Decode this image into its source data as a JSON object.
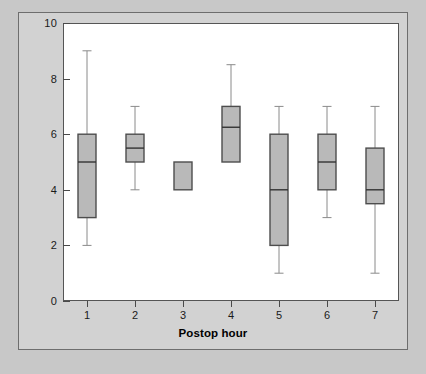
{
  "chart_data": {
    "type": "box",
    "title": "",
    "xlabel": "Postop hour",
    "ylabel": "Postoperative pain scores",
    "xlim": [
      0.5,
      7.5
    ],
    "ylim": [
      0,
      10
    ],
    "grid": false,
    "legend": null,
    "y_ticks": [
      0,
      2,
      4,
      6,
      8,
      10
    ],
    "y_tick_labels": [
      "0",
      "2",
      "4",
      "6",
      "8",
      "10"
    ],
    "x_ticks": [
      1,
      2,
      3,
      4,
      5,
      6,
      7
    ],
    "x_tick_labels": [
      "1",
      "2",
      "3",
      "4",
      "5",
      "6",
      "7"
    ],
    "categories": [
      "1",
      "2",
      "3",
      "4",
      "5",
      "6",
      "7"
    ],
    "boxes": [
      {
        "category": "1",
        "whisker_low": 2,
        "q1": 3,
        "median": 5,
        "q3": 6,
        "whisker_high": 9
      },
      {
        "category": "2",
        "whisker_low": 4,
        "q1": 5,
        "median": 5.5,
        "q3": 6,
        "whisker_high": 7
      },
      {
        "category": "3",
        "whisker_low": 4,
        "q1": 4,
        "median": 4,
        "q3": 5,
        "whisker_high": 5
      },
      {
        "category": "4",
        "whisker_low": 5,
        "q1": 5,
        "median": 6.25,
        "q3": 7,
        "whisker_high": 8.5
      },
      {
        "category": "5",
        "whisker_low": 1,
        "q1": 2,
        "median": 4,
        "q3": 6,
        "whisker_high": 7
      },
      {
        "category": "6",
        "whisker_low": 3,
        "q1": 4,
        "median": 5,
        "q3": 6,
        "whisker_high": 7
      },
      {
        "category": "7",
        "whisker_low": 1,
        "q1": 3.5,
        "median": 4,
        "q3": 5.5,
        "whisker_high": 7
      }
    ]
  },
  "colors": {
    "page_background": "#c8c8c8",
    "figure_background": "#d2d2d2",
    "plot_background": "#ffffff",
    "box_fill": "#b9b9b9",
    "box_stroke": "#4d4d4d",
    "median_stroke": "#333333",
    "whisker_stroke": "#8a8a8a",
    "axis_text": "#1a1a1a"
  },
  "caption": ""
}
